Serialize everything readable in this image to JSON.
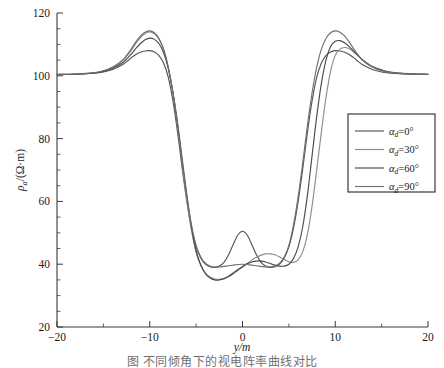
{
  "chart_data": {
    "type": "line",
    "title": "",
    "xlabel": "y/m",
    "ylabel": "ρa/(Ω·m)",
    "ylabel_parts": {
      "symbol": "ρ",
      "subscript": "a",
      "unit": "/(Ω·m)"
    },
    "xlim": [
      -20,
      20
    ],
    "ylim": [
      20,
      120
    ],
    "xticks": [
      -20,
      -10,
      0,
      10,
      20
    ],
    "xticklabels": [
      "−20",
      "−10",
      "0",
      "10",
      "20"
    ],
    "yticks": [
      20,
      40,
      60,
      80,
      100,
      120
    ],
    "yticklabels": [
      "20",
      "40",
      "60",
      "80",
      "100",
      "120"
    ],
    "x_minor_step": 5,
    "y_minor_step": 5,
    "grid": false,
    "legend_position": "upper right",
    "series": [
      {
        "name": "αd=0°",
        "color": "#555555",
        "x": [
          -20,
          -18,
          -16,
          -15,
          -14,
          -13,
          -12.5,
          -12,
          -11.5,
          -11,
          -10.5,
          -10,
          -9.5,
          -9,
          -8.5,
          -8,
          -7.5,
          -7,
          -6.5,
          -6,
          -5.5,
          -5,
          -4.5,
          -4,
          -3.5,
          -3,
          -2.5,
          -2,
          -1.5,
          -1,
          -0.5,
          0,
          0.5,
          1,
          1.5,
          2,
          2.5,
          3,
          3.5,
          4,
          4.5,
          5,
          5.5,
          6,
          6.5,
          7,
          7.5,
          8,
          8.5,
          9,
          9.5,
          10,
          10.5,
          11,
          11.5,
          12,
          12.5,
          13,
          14,
          15,
          16,
          18,
          20
        ],
        "y": [
          100.4,
          100.5,
          100.8,
          101.2,
          102.0,
          103.4,
          104.5,
          105.7,
          106.8,
          107.5,
          107.9,
          108.0,
          107.6,
          106.4,
          104.0,
          99.5,
          92.0,
          82.0,
          70.5,
          60.0,
          51.5,
          45.5,
          42.0,
          40.0,
          39.2,
          39.0,
          39.4,
          40.6,
          43.0,
          46.3,
          49.3,
          50.5,
          49.3,
          46.3,
          43.0,
          40.6,
          39.4,
          39.0,
          39.2,
          40.0,
          42.0,
          45.5,
          51.5,
          60.0,
          70.5,
          82.0,
          92.0,
          99.5,
          104.0,
          106.4,
          107.6,
          108.0,
          107.9,
          107.5,
          106.8,
          105.7,
          104.5,
          103.4,
          102.0,
          101.2,
          100.8,
          100.5,
          100.4
        ]
      },
      {
        "name": "αd=30°",
        "color": "#8c8c8c",
        "x": [
          -20,
          -18,
          -16,
          -15,
          -14,
          -13,
          -12.5,
          -12,
          -11.5,
          -11,
          -10.5,
          -10,
          -9.5,
          -9,
          -8.5,
          -8,
          -7.5,
          -7,
          -6.5,
          -6,
          -5.5,
          -5,
          -4.5,
          -4,
          -3.5,
          -3,
          -2.5,
          -2,
          -1.5,
          -1,
          -0.5,
          0,
          0.5,
          1,
          1.5,
          2,
          2.5,
          3,
          3.5,
          4,
          4.5,
          5,
          5.5,
          6,
          6.5,
          7,
          7.5,
          8,
          8.5,
          9,
          9.5,
          10,
          10.5,
          11,
          11.5,
          12,
          12.5,
          13,
          14,
          15,
          16,
          18,
          20
        ],
        "y": [
          100.4,
          100.5,
          100.9,
          101.5,
          102.6,
          104.6,
          106.2,
          108.1,
          110.3,
          112.2,
          113.5,
          114.0,
          113.4,
          111.6,
          108.2,
          102.6,
          94.5,
          84.0,
          72.0,
          60.5,
          50.8,
          43.8,
          39.6,
          37.2,
          35.9,
          35.3,
          35.2,
          35.4,
          36.0,
          36.9,
          38.0,
          39.1,
          40.2,
          41.3,
          42.2,
          42.9,
          43.3,
          43.3,
          43.0,
          42.3,
          41.5,
          40.8,
          40.6,
          41.4,
          44.0,
          49.5,
          58.5,
          70.0,
          82.0,
          93.0,
          101.5,
          106.5,
          108.5,
          109.0,
          108.6,
          107.6,
          106.3,
          105.0,
          103.0,
          101.9,
          101.2,
          100.7,
          100.5
        ]
      },
      {
        "name": "αd=60°",
        "color": "#4a4a4a",
        "x": [
          -20,
          -18,
          -16,
          -15,
          -14,
          -13,
          -12.5,
          -12,
          -11.5,
          -11,
          -10.5,
          -10,
          -9.5,
          -9,
          -8.5,
          -8,
          -7.5,
          -7,
          -6.5,
          -6,
          -5.5,
          -5,
          -4.5,
          -4,
          -3.5,
          -3,
          -2.5,
          -2,
          -1.5,
          -1,
          -0.5,
          0,
          0.5,
          1,
          1.5,
          2,
          2.5,
          3,
          3.5,
          4,
          4.5,
          5,
          5.5,
          6,
          6.5,
          7,
          7.5,
          8,
          8.5,
          9,
          9.5,
          10,
          10.5,
          11,
          11.5,
          12,
          12.5,
          13,
          14,
          15,
          16,
          18,
          20
        ],
        "y": [
          100.4,
          100.5,
          100.9,
          101.4,
          102.4,
          104.0,
          105.3,
          106.9,
          108.7,
          110.3,
          111.5,
          112.0,
          111.6,
          110.2,
          107.3,
          102.2,
          94.8,
          85.0,
          73.5,
          62.0,
          51.8,
          44.2,
          39.8,
          37.0,
          35.6,
          35.0,
          35.0,
          35.4,
          36.2,
          37.2,
          38.3,
          39.3,
          40.1,
          40.7,
          41.0,
          41.0,
          40.7,
          40.2,
          39.7,
          39.4,
          39.4,
          40.0,
          41.8,
          45.5,
          52.0,
          62.0,
          74.5,
          87.0,
          97.5,
          105.0,
          109.3,
          111.0,
          111.2,
          110.5,
          109.3,
          107.8,
          106.3,
          104.9,
          102.8,
          101.8,
          101.1,
          100.6,
          100.5
        ]
      },
      {
        "name": "αd=90°",
        "color": "#707070",
        "x": [
          -20,
          -18,
          -16,
          -15,
          -14,
          -13,
          -12.5,
          -12,
          -11.5,
          -11,
          -10.5,
          -10,
          -9.5,
          -9,
          -8.5,
          -8,
          -7.5,
          -7,
          -6.5,
          -6,
          -5.5,
          -5,
          -4.5,
          -4,
          -3.5,
          -3,
          -2.5,
          -2,
          -1.5,
          -1,
          -0.5,
          0,
          0.5,
          1,
          1.5,
          2,
          2.5,
          3,
          3.5,
          4,
          4.5,
          5,
          5.5,
          6,
          6.5,
          7,
          7.5,
          8,
          8.5,
          9,
          9.5,
          10,
          10.5,
          11,
          11.5,
          12,
          12.5,
          13,
          14,
          15,
          16,
          18,
          20
        ],
        "y": [
          100.5,
          100.6,
          101.0,
          101.6,
          102.8,
          104.8,
          106.5,
          108.5,
          110.8,
          112.7,
          113.9,
          114.3,
          113.7,
          111.9,
          108.5,
          102.8,
          94.6,
          84.2,
          72.5,
          61.5,
          52.5,
          46.0,
          42.3,
          40.3,
          39.4,
          39.1,
          39.1,
          39.3,
          39.5,
          39.7,
          39.9,
          40.0,
          39.9,
          39.7,
          39.5,
          39.3,
          39.1,
          39.1,
          39.4,
          40.3,
          42.3,
          46.0,
          52.5,
          61.5,
          72.5,
          84.2,
          94.6,
          102.8,
          108.5,
          111.9,
          113.7,
          114.3,
          113.9,
          112.7,
          110.8,
          108.5,
          106.5,
          104.8,
          102.8,
          101.6,
          101.0,
          100.6,
          100.5
        ]
      }
    ]
  },
  "legend": {
    "items": [
      {
        "label": "αd=0°",
        "symbol": "α",
        "subscript": "d",
        "value": "=0°",
        "color": "#555555"
      },
      {
        "label": "αd=30°",
        "symbol": "α",
        "subscript": "d",
        "value": "=30°",
        "color": "#8c8c8c"
      },
      {
        "label": "αd=60°",
        "symbol": "α",
        "subscript": "d",
        "value": "=60°",
        "color": "#4a4a4a"
      },
      {
        "label": "αd=90°",
        "symbol": "α",
        "subscript": "d",
        "value": "=90°",
        "color": "#707070"
      }
    ]
  },
  "caption": {
    "text": "图   不同倾角下的视电阵率曲线对比"
  }
}
